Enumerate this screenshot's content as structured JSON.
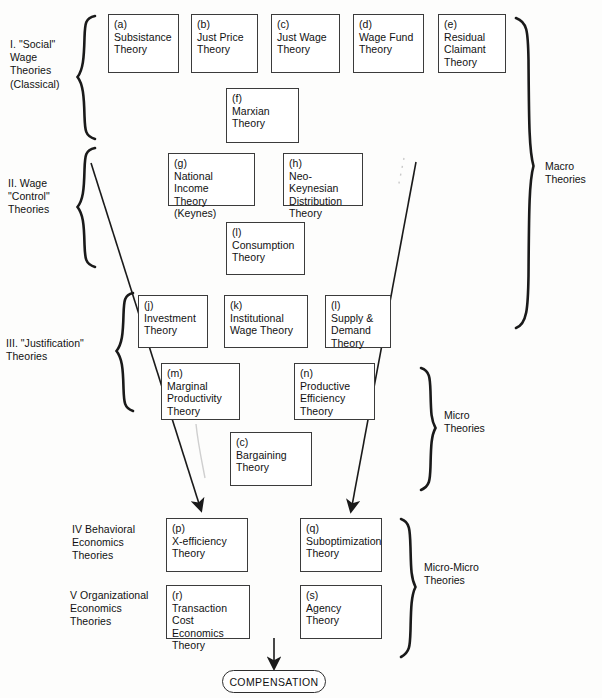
{
  "diagram": {
    "outcome_label": "COMPENSATION",
    "groups": [
      {
        "id": "I",
        "label": "I. \"Social\"\n    Wage\n    Theories\n    (Classical)"
      },
      {
        "id": "II",
        "label": "II. Wage\n     \"Control\"\n     Theories"
      },
      {
        "id": "III",
        "label": "III. \"Justification\"\n      Theories"
      },
      {
        "id": "IV",
        "label": "IV  Behavioral\n      Economics\n      Theories"
      },
      {
        "id": "V",
        "label": "V  Organizational\n     Economics\n     Theories"
      }
    ],
    "side_labels": [
      {
        "id": "macro",
        "label": "Macro\nTheories"
      },
      {
        "id": "micro",
        "label": "Micro\nTheories"
      },
      {
        "id": "micro-micro",
        "label": "Micro-Micro\nTheories"
      }
    ],
    "boxes": [
      {
        "key": "a",
        "tag": "(a)",
        "title": "Subsistance\nTheory"
      },
      {
        "key": "b",
        "tag": "(b)",
        "title": "Just Price\nTheory"
      },
      {
        "key": "c",
        "tag": "(c)",
        "title": "Just Wage\nTheory"
      },
      {
        "key": "d",
        "tag": "(d)",
        "title": "Wage Fund\nTheory"
      },
      {
        "key": "e",
        "tag": "(e)",
        "title": "Residual\nClaimant\nTheory"
      },
      {
        "key": "f",
        "tag": "(f)",
        "title": "Marxian\nTheory"
      },
      {
        "key": "g",
        "tag": "(g)",
        "title": "National Income\nTheory (Keynes)"
      },
      {
        "key": "h",
        "tag": "(h)",
        "title": "Neo-Keynesian\nDistribution\nTheory"
      },
      {
        "key": "i",
        "tag": "(l)",
        "title": "Consumption\nTheory"
      },
      {
        "key": "j",
        "tag": "(j)",
        "title": "Investment\nTheory"
      },
      {
        "key": "k",
        "tag": "(k)",
        "title": "Institutional\nWage Theory"
      },
      {
        "key": "l",
        "tag": "(l)",
        "title": "Supply &\nDemand\nTheory"
      },
      {
        "key": "m",
        "tag": "(m)",
        "title": "Marginal\nProductivity\nTheory"
      },
      {
        "key": "n",
        "tag": "(n)",
        "title": "Productive\nEfficiency\nTheory"
      },
      {
        "key": "o",
        "tag": "(c)",
        "title": "Bargaining\nTheory"
      },
      {
        "key": "p",
        "tag": "(p)",
        "title": "X-efficiency\nTheory"
      },
      {
        "key": "q",
        "tag": "(q)",
        "title": "Suboptimization\nTheory"
      },
      {
        "key": "r",
        "tag": "(r)",
        "title": "Transaction\nCost Economics\nTheory"
      },
      {
        "key": "s",
        "tag": "(s)",
        "title": "Agency\nTheory"
      }
    ],
    "colors": {
      "stroke": "#3b3b3b",
      "text": "#111111",
      "background": "#fdfdfc"
    }
  }
}
